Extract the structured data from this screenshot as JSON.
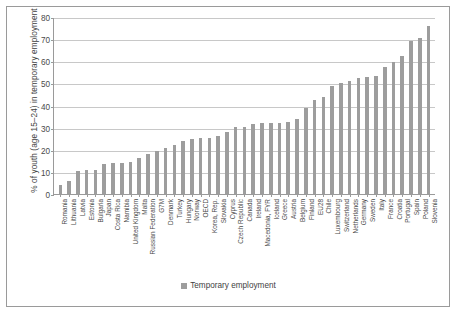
{
  "chart_data": {
    "type": "bar",
    "title": "",
    "xlabel": "",
    "ylabel": "% of youth (age 15–24) in temporary employment",
    "ylim": [
      0,
      80
    ],
    "yticks": [
      0,
      10,
      20,
      30,
      40,
      50,
      60,
      70,
      80
    ],
    "grid": "horizontal",
    "legend_position": "bottom",
    "series_name": "Temporary employment",
    "bar_color": "#9d9d9d",
    "categories": [
      "Romania",
      "Lithuania",
      "Latvia",
      "Estonia",
      "Bulgaria",
      "Japan",
      "Costa Rica",
      "Namibia",
      "United Kingdom",
      "Malta",
      "Russian Federation",
      "G7M",
      "Denmark",
      "Turkey",
      "Hungary",
      "Norway",
      "OECD",
      "Korea, Rep.",
      "Slovakia",
      "Cyprus",
      "Czech Republic",
      "Canada",
      "Ireland",
      "Macedonia, FYR",
      "Iceland",
      "Greece",
      "Austria",
      "Belgium",
      "Finland",
      "EU28",
      "Chile",
      "Luxembourg",
      "Switzerland",
      "Netherlands",
      "Germany",
      "Sweden",
      "Italy",
      "France",
      "Croatia",
      "Portugal",
      "Spain",
      "Poland",
      "Slovenia"
    ],
    "values": [
      4.0,
      6.0,
      10.5,
      11.0,
      11.0,
      13.5,
      14.0,
      14.0,
      14.5,
      16.5,
      18.0,
      19.5,
      21.0,
      22.0,
      24.0,
      25.0,
      25.5,
      25.5,
      26.0,
      28.0,
      30.5,
      30.5,
      31.5,
      32.0,
      32.0,
      32.0,
      32.5,
      34.0,
      39.0,
      42.5,
      44.0,
      49.0,
      50.0,
      51.0,
      52.5,
      53.0,
      53.5,
      57.5,
      59.5,
      62.5,
      69.0,
      70.5,
      76.0
    ]
  },
  "legend": {
    "label": "Temporary employment"
  }
}
